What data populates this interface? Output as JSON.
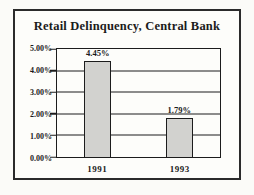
{
  "chart_data": {
    "type": "bar",
    "title": "Retail Delinquency, Central Bank",
    "categories": [
      "1991",
      "1993"
    ],
    "values": [
      4.45,
      1.79
    ],
    "value_labels": [
      "4.45%",
      "1.79%"
    ],
    "xlabel": "",
    "ylabel": "",
    "ylim": [
      0,
      5
    ],
    "ytick_step": 1,
    "ytick_labels": [
      "0.00%",
      "1.00%",
      "2.00%",
      "3.00%",
      "4.00%",
      "5.00%"
    ],
    "grid": "horizontal",
    "legend": "none",
    "colors": {
      "bar_fill": "#d2d2cf",
      "line": "#1c1c1c",
      "frame_border": "#2b2b2b",
      "background": "#fdfdfa"
    }
  }
}
